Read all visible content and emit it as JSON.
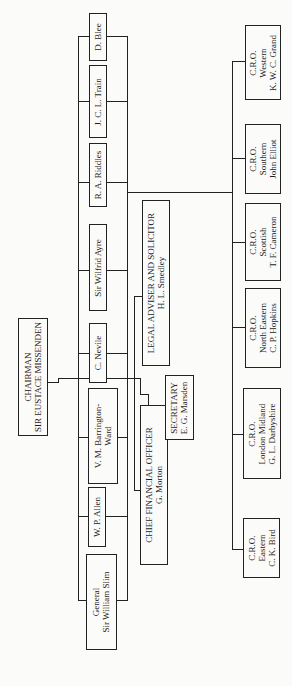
{
  "chairman": {
    "title": "CHAIRMAN",
    "name": "SIR EUSTACE MISSENDEN"
  },
  "board_members": [
    {
      "name": "D. Blee"
    },
    {
      "name": "J. C. L. Train"
    },
    {
      "name": "R. A. Riddles"
    },
    {
      "name": "Sir Wilfrid Ayre"
    },
    {
      "name": "C. Nevile"
    },
    {
      "line1": "V. M. Barrington-",
      "line2": "Ward"
    },
    {
      "name": "W. P. Allen"
    },
    {
      "line1": "General",
      "line2": "Sir William Slim"
    }
  ],
  "officers": {
    "legal": {
      "title": "LEGAL ADVISER AND SOLICITOR",
      "name": "H. L. Smedley"
    },
    "cfo": {
      "title": "CHIEF FINANCIAL OFFICER",
      "name": "G. Morton"
    },
    "secretary": {
      "title": "SECRETARY",
      "name": "E. G. Marsden"
    }
  },
  "regions": [
    {
      "role": "C.R.O.",
      "region": "Western",
      "name": "K. W. C. Grand"
    },
    {
      "role": "C.R.O.",
      "region": "Southern",
      "name": "John Elliot"
    },
    {
      "role": "C.R.O.",
      "region": "Scottish",
      "name": "T. F. Cameron"
    },
    {
      "role": "C.R.O.",
      "region": "North Eastern",
      "name": "C. P. Hopkins"
    },
    {
      "role": "C.R.O.",
      "region": "London Midland",
      "name": "G. L. Darbyshire"
    },
    {
      "role": "C.R.O.",
      "region": "Eastern",
      "name": "C. K. Bird"
    }
  ]
}
